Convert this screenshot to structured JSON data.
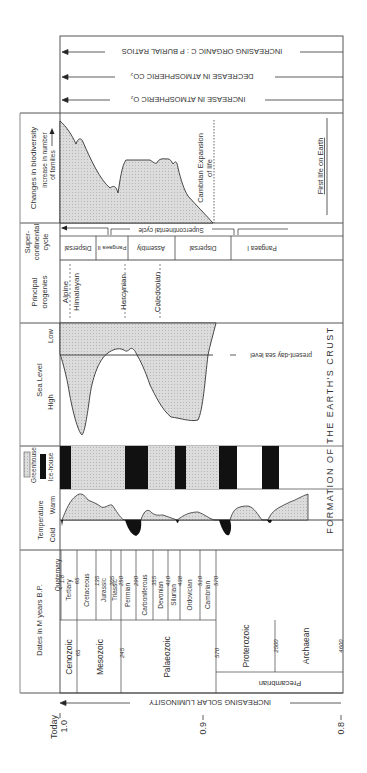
{
  "colors": {
    "shade": "#d9d9d9",
    "ink": "#333333",
    "black": "#111111",
    "white": "#ffffff"
  },
  "arrows": {
    "burial": "INCREASING ORGANIC C : P BURIAL RATIOS",
    "co2": "DECREASE IN ATMOSPHERIC CO₂",
    "o2": "INCREASE IN ATMOSPHERIC O₂",
    "luminosity": "INCREASING SOLAR LUMINOSITY"
  },
  "headers": {
    "biodiversity_title": "Changes in biodiversity",
    "biodiversity_sub1": "increase in number",
    "biodiversity_sub2": "of families",
    "super1": "Super-",
    "super2": "continental",
    "super3": "cycle",
    "orogenies1": "Principal",
    "orogenies2": "orogenies",
    "sea_level": "Sea Level",
    "sea_low": "Low",
    "sea_high": "High",
    "greenhouse": "Greenhouse",
    "icehouse": "Ice-house",
    "temperature": "Temperature",
    "temp_cold": "Cold",
    "temp_warm": "Warm",
    "dates": "Dates in M years B.P."
  },
  "biodiversity": {
    "cambrian": "Cambrian Expansion",
    "of_life": "of life",
    "first_life": "First life on Earth"
  },
  "supercontinent": {
    "cycle_label": "Supercontinental cycle",
    "phases": [
      "Dispersal",
      "Pangaea II",
      "Assembly",
      "Dispersal",
      "Pangaea I"
    ]
  },
  "orogenies": [
    "Alpine",
    "Himalayan",
    "Hercynian",
    "Caledonian"
  ],
  "sea_level_note": "present-day sea level",
  "crust_label": "FORMATION OF THE EARTH'S CRUST",
  "periods": [
    {
      "name": "Quaternary",
      "end": "1.8"
    },
    {
      "name": "Tertiary",
      "end": "65"
    },
    {
      "name": "Cretaceous",
      "end": "135"
    },
    {
      "name": "Jurassic",
      "end": "205"
    },
    {
      "name": "Triassic",
      "end": "250"
    },
    {
      "name": "Permian",
      "end": "290"
    },
    {
      "name": "Carboniferous",
      "end": "355"
    },
    {
      "name": "Devonian",
      "end": "410"
    },
    {
      "name": "Silurian",
      "end": "438"
    },
    {
      "name": "Ordovician",
      "end": "510"
    },
    {
      "name": "Cambrian",
      "end": "570"
    }
  ],
  "eras": [
    {
      "name": "Cenozoic",
      "end": "65"
    },
    {
      "name": "Mesozoic",
      "end": "245"
    },
    {
      "name": "Palaeozoic",
      "end": "570"
    },
    {
      "name": "Proterozoic",
      "end": "2500"
    },
    {
      "name": "Archaean",
      "end": "4600"
    }
  ],
  "eon": "Precambrian",
  "luminosity_axis": {
    "today": "Today",
    "ticks": [
      "1.0",
      "0.9",
      "0.8"
    ]
  }
}
